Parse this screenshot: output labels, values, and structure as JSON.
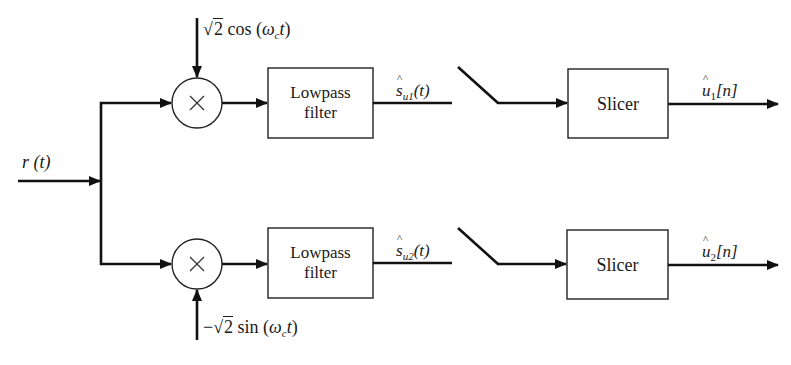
{
  "diagram": {
    "type": "block-diagram",
    "input": {
      "label": "r (t)",
      "symbol": "r",
      "arg": "(t)"
    },
    "branches": [
      {
        "id": "in-phase",
        "oscillator": {
          "label": "√2 cos (ω_c t)",
          "sign": "",
          "coef": "2",
          "func": "cos",
          "arg_open": "(",
          "omega": "ω",
          "omega_sub": "c",
          "t": "t",
          "arg_close": ")"
        },
        "mixer_symbol": "×",
        "filter": {
          "line1": "Lowpass",
          "line2": "filter"
        },
        "filter_output": {
          "label": "ŝ_u1(t)",
          "symbol": "s",
          "sub": "u1",
          "arg": "(t)"
        },
        "sampler": "switch",
        "slicer": {
          "label": "Slicer"
        },
        "output": {
          "label": "û_1[n]",
          "symbol": "u",
          "sub": "1",
          "arg": "[n]"
        }
      },
      {
        "id": "quadrature",
        "oscillator": {
          "label": "−√2 sin (ω_c t)",
          "sign": "−",
          "coef": "2",
          "func": "sin",
          "arg_open": "(",
          "omega": "ω",
          "omega_sub": "c",
          "t": "t",
          "arg_close": ")"
        },
        "mixer_symbol": "×",
        "filter": {
          "line1": "Lowpass",
          "line2": "filter"
        },
        "filter_output": {
          "label": "ŝ_u2(t)",
          "symbol": "s",
          "sub": "u2",
          "arg": "(t)"
        },
        "sampler": "switch",
        "slicer": {
          "label": "Slicer"
        },
        "output": {
          "label": "û_2[n]",
          "symbol": "u",
          "sub": "2",
          "arg": "[n]"
        }
      }
    ],
    "colors": {
      "line": "#111111",
      "background": "#ffffff",
      "text": "#1a1a1a"
    }
  }
}
